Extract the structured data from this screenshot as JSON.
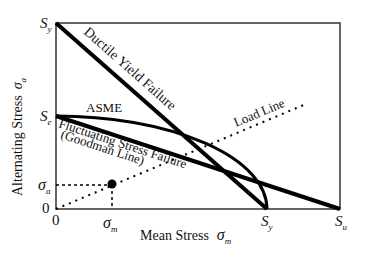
{
  "diagram": {
    "axes": {
      "ylabel": "Alternating Stress",
      "ylabel_symbol": "σ",
      "ylabel_subscript": "a",
      "xlabel": "Mean Stress",
      "xlabel_symbol": "σ",
      "xlabel_subscript": "m"
    },
    "y_ticks": [
      {
        "symbol": "S",
        "sub": "y"
      },
      {
        "symbol": "S",
        "sub": "e"
      },
      {
        "symbol": "σ",
        "sub": "a"
      },
      {
        "symbol": "0",
        "sub": ""
      }
    ],
    "x_ticks": [
      {
        "symbol": "0",
        "sub": ""
      },
      {
        "symbol": "σ",
        "sub": "m"
      },
      {
        "symbol": "S",
        "sub": "y"
      },
      {
        "symbol": "S",
        "sub": "u"
      }
    ],
    "curves": {
      "ductile_yield": "Ductile Yield Failure",
      "asme": "ASME",
      "goodman_line1": "Fluctuating Stress Failure",
      "goodman_line2": "(Goodman Line)",
      "load_line": "Load Line"
    },
    "colors": {
      "line": "#000000",
      "frame": "#333333",
      "text": "#111111"
    }
  }
}
